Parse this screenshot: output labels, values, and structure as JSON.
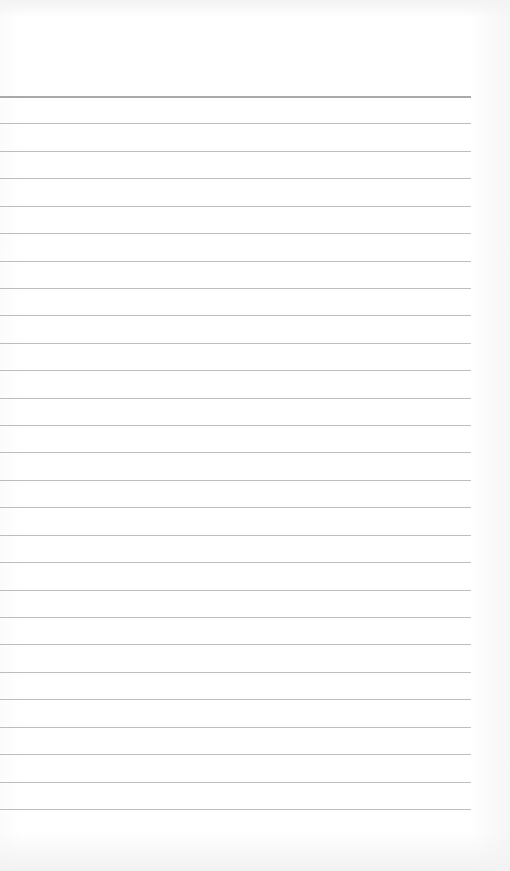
{
  "page": {
    "type": "blank ruled notebook page",
    "background_color": "#ffffff",
    "line_color": "#bdbdbd",
    "header_line_color": "#a9a9a9",
    "line_count": 27,
    "first_line_y": 96,
    "line_spacing": 27.42,
    "line_length": 471
  }
}
